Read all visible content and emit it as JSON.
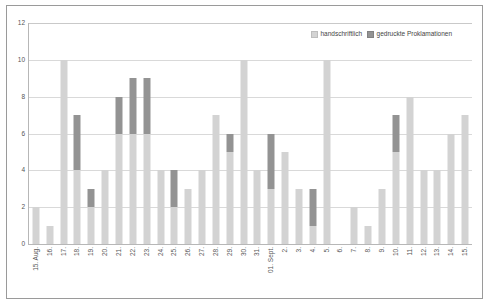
{
  "chart_data": {
    "type": "bar",
    "stacked": true,
    "title": "",
    "subtitle": "",
    "xlabel": "",
    "ylabel": "",
    "ylim": [
      0,
      12
    ],
    "ytick_step": 2,
    "yticks": [
      0,
      2,
      4,
      6,
      8,
      10,
      12
    ],
    "ytick_labels": [
      "0",
      "2",
      "4",
      "6",
      "8",
      "10",
      "12"
    ],
    "grid": true,
    "grid_axis": "y",
    "legend_position": "top-right",
    "categories": [
      "15. Aug.",
      "16.",
      "17.",
      "18.",
      "19.",
      "20.",
      "21.",
      "22.",
      "23.",
      "24.",
      "25.",
      "26.",
      "27.",
      "28.",
      "29.",
      "30.",
      "31.",
      "01. Sept.",
      "2.",
      "3.",
      "4.",
      "5.",
      "6.",
      "7.",
      "8.",
      "9.",
      "10.",
      "11.",
      "12.",
      "13.",
      "14.",
      "15."
    ],
    "series": [
      {
        "name": "handschriftlich",
        "color": "#d3d3d3",
        "values": [
          2,
          1,
          10,
          4,
          2,
          4,
          6,
          6,
          6,
          4,
          2,
          3,
          4,
          7,
          5,
          10,
          4,
          3,
          5,
          3,
          1,
          10,
          0,
          2,
          1,
          3,
          5,
          8,
          4,
          4,
          6,
          7
        ]
      },
      {
        "name": "gedruckte Proklamationen",
        "color": "#939393",
        "values": [
          0,
          0,
          0,
          3,
          1,
          0,
          2,
          3,
          3,
          0,
          2,
          0,
          0,
          0,
          1,
          0,
          0,
          3,
          0,
          0,
          2,
          0,
          0,
          0,
          0,
          0,
          2,
          0,
          0,
          0,
          0,
          0
        ]
      }
    ],
    "totals": [
      2,
      1,
      10,
      7,
      3,
      4,
      8,
      9,
      9,
      4,
      4,
      3,
      4,
      7,
      6,
      10,
      4,
      6,
      5,
      3,
      3,
      10,
      0,
      2,
      1,
      3,
      7,
      8,
      4,
      4,
      6,
      7
    ]
  },
  "legend": {
    "items": [
      {
        "label": "handschriftlich",
        "swatch": "legend-swatch-handschriftlich"
      },
      {
        "label": "gedruckte Proklamationen",
        "swatch": "legend-swatch-gedruckte"
      }
    ]
  },
  "colors": {
    "handschriftlich": "#d3d3d3",
    "gedruckte": "#939393",
    "gridline": "#d9d9d9",
    "axis": "#b7b7b7",
    "frame": "#9a9a9a",
    "background": "#ffffff",
    "tick_text": "#555555"
  }
}
